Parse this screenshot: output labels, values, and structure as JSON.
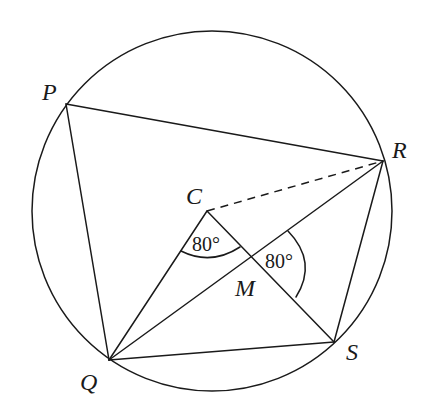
{
  "diagram": {
    "circle": {
      "cx": 212,
      "cy": 211,
      "r": 180
    },
    "points": {
      "P": {
        "x": 66,
        "y": 104,
        "label": "P"
      },
      "Q": {
        "x": 109,
        "y": 360,
        "label": "Q"
      },
      "R": {
        "x": 383,
        "y": 161,
        "label": "R"
      },
      "S": {
        "x": 334,
        "y": 342,
        "label": "S"
      },
      "C": {
        "x": 207,
        "y": 211,
        "label": "C"
      },
      "M": {
        "x": 251,
        "y": 258,
        "label": "M"
      }
    },
    "segments": [
      {
        "from": "P",
        "to": "R",
        "style": "solid"
      },
      {
        "from": "P",
        "to": "Q",
        "style": "solid"
      },
      {
        "from": "Q",
        "to": "S",
        "style": "solid"
      },
      {
        "from": "S",
        "to": "R",
        "style": "solid"
      },
      {
        "from": "Q",
        "to": "R",
        "style": "solid"
      },
      {
        "from": "Q",
        "to": "C",
        "style": "solid"
      },
      {
        "from": "C",
        "to": "S",
        "style": "solid"
      },
      {
        "from": "C",
        "to": "R",
        "style": "dashed"
      }
    ],
    "angles": [
      {
        "vertex": "C",
        "between": [
          "Q",
          "S"
        ],
        "value": "80°"
      },
      {
        "vertex": "M",
        "between": [
          "R",
          "S"
        ],
        "value": "80°"
      }
    ]
  }
}
